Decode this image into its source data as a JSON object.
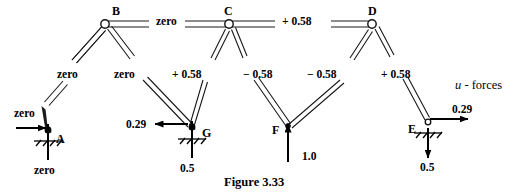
{
  "figure": {
    "caption": "Figure 3.33",
    "annotation_italic": "u",
    "annotation_rest": " - forces"
  },
  "nodes": [
    {
      "id": "B",
      "label": "B",
      "x": 105,
      "y": 24,
      "label_x": 112,
      "label_y": 6,
      "support": false
    },
    {
      "id": "C",
      "label": "C",
      "x": 229,
      "y": 24,
      "label_x": 224,
      "label_y": 6,
      "support": false
    },
    {
      "id": "D",
      "label": "D",
      "x": 372,
      "y": 24,
      "label_x": 368,
      "label_y": 6,
      "support": false
    },
    {
      "id": "A",
      "label": "A",
      "x": 48,
      "y": 132,
      "label_x": 56,
      "label_y": 136,
      "support": true
    },
    {
      "id": "G",
      "label": "G",
      "x": 192,
      "y": 130,
      "label_x": 202,
      "label_y": 130,
      "support": true
    },
    {
      "id": "F",
      "label": "F",
      "x": 288,
      "y": 128,
      "label_x": 272,
      "label_y": 127,
      "support": false
    },
    {
      "id": "E",
      "label": "E",
      "x": 428,
      "y": 124,
      "label_x": 408,
      "label_y": 126,
      "support": true
    }
  ],
  "members": [
    {
      "name": "B-C",
      "from": "B",
      "to": "C",
      "force": "zero",
      "label_x": 156,
      "label_y": 17
    },
    {
      "name": "C-D",
      "from": "C",
      "to": "D",
      "force": "+ 0.58",
      "label_x": 282,
      "label_y": 17
    },
    {
      "name": "B-A",
      "from": "B",
      "to": "A",
      "force": "zero",
      "label_x": 57,
      "label_y": 70
    },
    {
      "name": "B-G",
      "from": "B",
      "to": "G",
      "force": "zero",
      "label_x": 114,
      "label_y": 70
    },
    {
      "name": "C-G",
      "from": "C",
      "to": "G",
      "force": "+ 0.58",
      "label_x": 172,
      "label_y": 70
    },
    {
      "name": "C-F",
      "from": "C",
      "to": "F",
      "force": "− 0.58",
      "label_x": 243,
      "label_y": 70
    },
    {
      "name": "D-F",
      "from": "D",
      "to": "F",
      "force": "− 0.58",
      "label_x": 307,
      "label_y": 70
    },
    {
      "name": "D-E",
      "from": "D",
      "to": "E",
      "force": "+ 0.58",
      "label_x": 381,
      "label_y": 70
    }
  ],
  "forces": [
    {
      "name": "reaction-A-horizontal",
      "at": "A",
      "value": "zero",
      "direction": "right",
      "label_x": 14,
      "label_y": 109
    },
    {
      "name": "reaction-A-vertical",
      "at": "A",
      "value": "zero",
      "direction": "up",
      "label_x": 34,
      "label_y": 166
    },
    {
      "name": "reaction-G-horizontal",
      "at": "G",
      "value": "0.29",
      "direction": "left",
      "label_x": 126,
      "label_y": 130
    },
    {
      "name": "reaction-G-vertical",
      "at": "G",
      "value": "0.5",
      "direction": "up",
      "label_x": 180,
      "label_y": 164
    },
    {
      "name": "load-F-vertical",
      "at": "F",
      "value": "1.0",
      "direction": "up",
      "label_x": 302,
      "label_y": 152
    },
    {
      "name": "reaction-E-horizontal",
      "at": "E",
      "value": "0.29",
      "direction": "right",
      "label_x": 452,
      "label_y": 109
    },
    {
      "name": "reaction-E-vertical",
      "at": "E",
      "value": "0.5",
      "direction": "down",
      "label_x": 420,
      "label_y": 163
    }
  ],
  "colors": {
    "ink": "#000000",
    "member_fill": "#ffffff",
    "member_stroke": "#1a1a1a",
    "background": "#ffffff"
  }
}
